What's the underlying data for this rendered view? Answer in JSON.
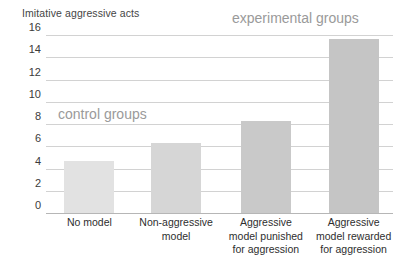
{
  "chart_data": {
    "type": "bar",
    "title": "",
    "xlabel": "",
    "ylabel": "Imitative aggressive acts",
    "ylim": [
      0,
      16
    ],
    "ytick_step": 2,
    "yticks": [
      "16",
      "14",
      "12",
      "10",
      "8",
      "6",
      "4",
      "2",
      "0"
    ],
    "grid": true,
    "legend": "none",
    "categories": [
      "No model",
      "Non-aggressive model",
      "Aggressive model punished for aggression",
      "Aggressive model rewarded for aggression"
    ],
    "values": [
      4.7,
      6.3,
      8.3,
      15.6
    ],
    "annotations": [
      {
        "text": "control groups",
        "covers": [
          0,
          1
        ]
      },
      {
        "text": "experimental groups",
        "covers": [
          2,
          3
        ]
      }
    ],
    "bar_colors": [
      "#e2e2e2",
      "#d6d6d6",
      "#c9c9c9",
      "#c5c5c5"
    ],
    "grid_color": "#d2d2d2",
    "axis_color": "#b6b6b6",
    "annotation_color": "#9a9a9a"
  },
  "category_labels": [
    {
      "lines": [
        "No model"
      ]
    },
    {
      "lines": [
        "Non-aggressive",
        "model"
      ]
    },
    {
      "lines": [
        "Aggressive",
        "model punished",
        "for aggression"
      ]
    },
    {
      "lines": [
        "Aggressive",
        "model rewarded",
        "for aggression"
      ]
    }
  ]
}
